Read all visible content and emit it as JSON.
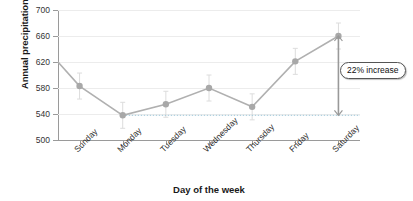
{
  "chart_data": {
    "type": "line",
    "title": "",
    "xlabel": "Day of the week",
    "ylabel": "Annual precipitation (mm)",
    "categories": [
      "Sunday",
      "Monday",
      "Tuesday",
      "Wednesday",
      "Thursday",
      "Friday",
      "Saturday"
    ],
    "values": [
      583,
      538,
      555,
      580,
      551,
      621,
      660
    ],
    "error_bars": [
      20,
      20,
      20,
      20,
      20,
      20,
      20
    ],
    "ylim": [
      500,
      700
    ],
    "yticks": [
      500,
      540,
      580,
      620,
      660,
      700
    ],
    "ytick_labels": [
      "500",
      "540",
      "580",
      "620",
      "660",
      "700"
    ],
    "grid": true,
    "legend": false,
    "reference_line": {
      "value": 538,
      "style": "dotted",
      "label": ""
    },
    "line_start_value": 620,
    "annotations": [
      {
        "text": "22% increase",
        "from_value": 538,
        "to_value": 660,
        "at_category": "Saturday",
        "arrow": "double-vertical"
      }
    ],
    "series_color": "#b0b0b0",
    "marker_color": "#a8a8a8",
    "grid_color": "#ececec",
    "axis_color": "#9a9a9a",
    "callout_border_color": "#555555",
    "text_color": "#1a1a1a"
  }
}
